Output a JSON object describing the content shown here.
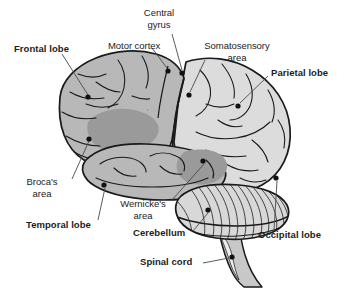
{
  "figure": {
    "background_color": "#ffffff",
    "line_color": "#1a1a1a",
    "colors": {
      "frontal_lobe_fill": "#b8b8b8",
      "temporal_lobe_fill": "#b8b8b8",
      "parietal_lobe_fill": "#dcdcdc",
      "occipital_lobe_fill": "#dcdcdc",
      "brocas_area_fill": "#9a9a9a",
      "wernickes_area_fill": "#9a9a9a",
      "cerebellum_fill": "#d8d8d8",
      "spinal_cord_fill": "#c8c8c8",
      "marker_dot": "#111111",
      "leader_line": "#4a4a4a"
    }
  },
  "labels": [
    {
      "id": "frontal-lobe",
      "text": "Frontal lobe",
      "weight": "bold",
      "align": "left",
      "x": 14,
      "y": 48,
      "marker": {
        "x": 88,
        "y": 97
      }
    },
    {
      "id": "motor-cortex",
      "text": "Motor cortex",
      "weight": "regular",
      "align": "left",
      "x": 108,
      "y": 45,
      "marker": {
        "x": 168,
        "y": 71
      }
    },
    {
      "id": "central-gyrus",
      "text": "Central\ngyrus",
      "line1": "Central",
      "line2": "gyrus",
      "weight": "regular",
      "align": "center",
      "x": 159,
      "y": 12,
      "marker": {
        "x": 182,
        "y": 73
      }
    },
    {
      "id": "somatosensory-area",
      "text": "Somatosensory\narea",
      "line1": "Somatosensory",
      "line2": "area",
      "weight": "regular",
      "align": "center",
      "x": 237,
      "y": 45,
      "marker": {
        "x": 189,
        "y": 95
      }
    },
    {
      "id": "parietal-lobe",
      "text": "Parietal lobe",
      "weight": "bold",
      "align": "left",
      "x": 271,
      "y": 72,
      "marker": {
        "x": 238,
        "y": 106
      }
    },
    {
      "id": "brocas-area",
      "text": "Broca's\narea",
      "line1": "Broca's",
      "line2": "area",
      "weight": "regular",
      "align": "center",
      "x": 41,
      "y": 181,
      "marker": {
        "x": 89,
        "y": 139
      }
    },
    {
      "id": "temporal-lobe",
      "text": "Temporal lobe",
      "weight": "bold",
      "align": "left",
      "x": 26,
      "y": 224,
      "marker": {
        "x": 104,
        "y": 185
      }
    },
    {
      "id": "wernickes-area",
      "text": "Wernicke's\narea",
      "line1": "Wernicke's",
      "line2": "area",
      "weight": "regular",
      "align": "center",
      "x": 143,
      "y": 203,
      "marker": {
        "x": 203,
        "y": 161
      }
    },
    {
      "id": "cerebellum",
      "text": "Cerebellum",
      "weight": "bold",
      "align": "left",
      "x": 133,
      "y": 232,
      "marker": {
        "x": 208,
        "y": 210
      }
    },
    {
      "id": "spinal-cord",
      "text": "Spinal cord",
      "weight": "bold",
      "align": "left",
      "x": 140,
      "y": 261,
      "marker": {
        "x": 232,
        "y": 257
      }
    },
    {
      "id": "occipital-lobe",
      "text": "Occipital lobe",
      "weight": "bold",
      "align": "left",
      "x": 258,
      "y": 234,
      "marker": {
        "x": 276,
        "y": 178
      }
    }
  ]
}
